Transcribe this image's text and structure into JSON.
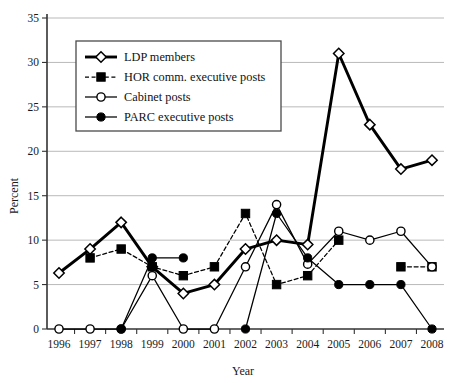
{
  "chart_data": {
    "type": "line",
    "title": "",
    "xlabel": "Year",
    "ylabel": "Percent",
    "categories": [
      1996,
      1997,
      1998,
      1999,
      2000,
      2001,
      2002,
      2003,
      2004,
      2005,
      2006,
      2007,
      2008
    ],
    "x": [
      "1996",
      "1997",
      "1998",
      "1999",
      "2000",
      "2001",
      "2002",
      "2003",
      "2004",
      "2005",
      "2006",
      "2007",
      "2008"
    ],
    "ylim": [
      0,
      35
    ],
    "yticks": [
      0,
      5,
      10,
      15,
      20,
      25,
      30,
      35
    ],
    "ytick_labels": [
      "0",
      "5",
      "10",
      "15",
      "20",
      "25",
      "30",
      "35"
    ],
    "grid": true,
    "legend_position": "upper-left-inside",
    "series": [
      {
        "name": "LDP members",
        "marker": "diamond-open",
        "line_style": "solid",
        "line_width": "thick",
        "values": [
          6.3,
          9,
          12,
          7,
          4,
          5,
          9,
          10,
          9.5,
          31,
          23,
          18,
          19
        ]
      },
      {
        "name": "HOR comm. executive posts",
        "marker": "square-filled",
        "line_style": "dashed",
        "line_width": "thin",
        "values": [
          null,
          8,
          9,
          7,
          6,
          7,
          13,
          5,
          6,
          10,
          null,
          7,
          7
        ]
      },
      {
        "name": "Cabinet posts",
        "marker": "circle-open",
        "line_style": "solid",
        "line_width": "thin",
        "values": [
          0,
          0,
          0,
          6,
          0,
          0,
          7,
          14,
          7.3,
          11,
          10,
          11,
          7
        ]
      },
      {
        "name": "PARC executive posts",
        "marker": "circle-filled",
        "line_style": "solid",
        "line_width": "thin",
        "values": [
          null,
          null,
          0,
          8,
          8,
          null,
          0,
          13,
          8,
          5,
          5,
          5,
          0
        ]
      }
    ],
    "legend": [
      "LDP members",
      "HOR comm. executive posts",
      "Cabinet posts",
      "PARC executive posts"
    ],
    "colors": {
      "series": "#000000",
      "grid": "#b9b9b9",
      "axis": "#333333",
      "background": "#ffffff"
    }
  }
}
